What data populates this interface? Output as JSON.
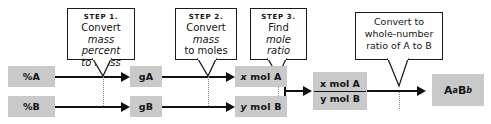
{
  "diagram": {
    "colors": {
      "box_fill": "#c9c9c9",
      "line": "#111111",
      "callout_border": "#1b1b1b",
      "dotted_guide": "#8a8a8a",
      "background": "#ffffff"
    }
  },
  "callouts": [
    {
      "id": "step1",
      "step": "STEP 1.",
      "line1": "Convert",
      "line2": "mass percent",
      "line3": "to mass"
    },
    {
      "id": "step2",
      "step": "STEP 2.",
      "line1": "Convert",
      "line2": "mass",
      "line3": "to moles"
    },
    {
      "id": "step3",
      "step": "STEP 3.",
      "line1": "Find",
      "line2": "mole ratio",
      "line3": ""
    },
    {
      "id": "final-step",
      "step": "",
      "line1": "Convert to",
      "line2": "whole-number",
      "line3": "ratio of A to B"
    }
  ],
  "nodes": {
    "percent_a": "%A",
    "percent_b": "%B",
    "grams_a": "gA",
    "grams_b": "gB",
    "moles_a_var": "x",
    "moles_a_unit": "mol A",
    "moles_b_var": "y",
    "moles_b_unit": "mol B",
    "ratio_numerator_var": "x",
    "ratio_numerator_unit": "mol A",
    "ratio_denominator_var": "y",
    "ratio_denominator_unit": "mol B",
    "formula_a": "A",
    "formula_a_sub": "a",
    "formula_b": "B",
    "formula_b_sub": "b"
  }
}
